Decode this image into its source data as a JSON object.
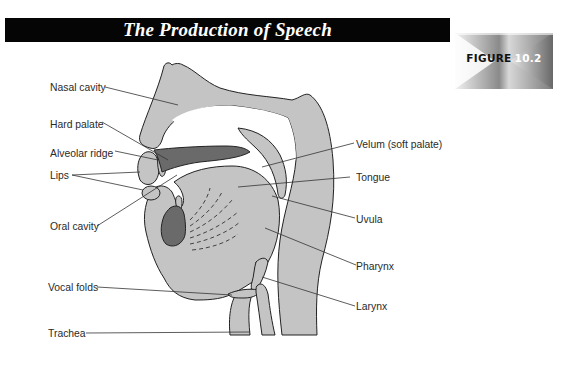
{
  "header": {
    "title": "The Production of Speech"
  },
  "figure_badge": {
    "word": "FIGURE",
    "number": "10.2"
  },
  "colors": {
    "title_bar": "#050505",
    "tissue": "#c4c4c4",
    "dark_tissue": "#6a6a6a",
    "outline": "#222222",
    "label_text": "#2a2a2a"
  },
  "labels": {
    "left": [
      {
        "id": "nasal-cavity",
        "text": "Nasal cavity"
      },
      {
        "id": "hard-palate",
        "text": "Hard palate"
      },
      {
        "id": "alveolar-ridge",
        "text": "Alveolar ridge"
      },
      {
        "id": "lips",
        "text": "Lips"
      },
      {
        "id": "oral-cavity",
        "text": "Oral cavity"
      },
      {
        "id": "vocal-folds",
        "text": "Vocal folds"
      },
      {
        "id": "trachea",
        "text": "Trachea"
      }
    ],
    "right": [
      {
        "id": "velum",
        "text": "Velum (soft palate)"
      },
      {
        "id": "tongue",
        "text": "Tongue"
      },
      {
        "id": "uvula",
        "text": "Uvula"
      },
      {
        "id": "pharynx",
        "text": "Pharynx"
      },
      {
        "id": "larynx",
        "text": "Larynx"
      }
    ]
  }
}
